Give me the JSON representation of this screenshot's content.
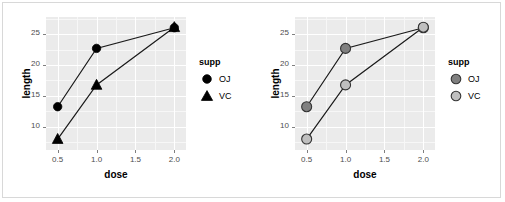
{
  "chart_data": [
    {
      "id": "left",
      "type": "line",
      "title": "",
      "xlabel": "dose",
      "ylabel": "length",
      "xlim": [
        0.35,
        2.15
      ],
      "ylim": [
        6.2,
        27.8
      ],
      "xticks": [
        "0.5",
        "1.0",
        "1.5",
        "2.0"
      ],
      "xtickvals": [
        0.5,
        1.0,
        1.5,
        2.0
      ],
      "yticks": [
        "10",
        "15",
        "20",
        "25"
      ],
      "ytickvals": [
        10,
        15,
        20,
        25
      ],
      "grid": true,
      "legend": {
        "title": "supp",
        "position": "right",
        "entries": [
          {
            "label": "OJ",
            "shape": "circle",
            "fill": "#000000",
            "stroke": "#000000"
          },
          {
            "label": "VC",
            "shape": "triangle",
            "fill": "#000000",
            "stroke": "#000000"
          }
        ]
      },
      "x": [
        0.5,
        1.0,
        2.0
      ],
      "series": [
        {
          "name": "OJ",
          "shape": "circle",
          "fill": "#000000",
          "stroke": "#000000",
          "line": "#1a1a1a",
          "values": [
            13.23,
            22.7,
            26.06
          ]
        },
        {
          "name": "VC",
          "shape": "triangle",
          "fill": "#000000",
          "stroke": "#000000",
          "line": "#1a1a1a",
          "values": [
            7.98,
            16.77,
            26.14
          ]
        }
      ]
    },
    {
      "id": "right",
      "type": "line",
      "title": "",
      "xlabel": "dose",
      "ylabel": "length",
      "xlim": [
        0.35,
        2.15
      ],
      "ylim": [
        6.2,
        27.8
      ],
      "xticks": [
        "0.5",
        "1.0",
        "1.5",
        "2.0"
      ],
      "xtickvals": [
        0.5,
        1.0,
        1.5,
        2.0
      ],
      "yticks": [
        "10",
        "15",
        "20",
        "25"
      ],
      "ytickvals": [
        10,
        15,
        20,
        25
      ],
      "grid": true,
      "legend": {
        "title": "supp",
        "position": "right",
        "entries": [
          {
            "label": "OJ",
            "shape": "circle",
            "fill": "#808080",
            "stroke": "#333333"
          },
          {
            "label": "VC",
            "shape": "circle",
            "fill": "#bfbfbf",
            "stroke": "#333333"
          }
        ]
      },
      "x": [
        0.5,
        1.0,
        2.0
      ],
      "series": [
        {
          "name": "OJ",
          "shape": "circle",
          "fill": "#808080",
          "stroke": "#333333",
          "line": "#1a1a1a",
          "values": [
            13.23,
            22.7,
            26.06
          ]
        },
        {
          "name": "VC",
          "shape": "circle",
          "fill": "#bfbfbf",
          "stroke": "#333333",
          "line": "#1a1a1a",
          "values": [
            7.98,
            16.77,
            26.14
          ]
        }
      ]
    }
  ],
  "panels": {
    "left": {
      "legend_title": "supp",
      "legend_oj": "OJ",
      "legend_vc": "VC",
      "xlabel": "dose",
      "ylabel": "length",
      "xt0": "0.5",
      "xt1": "1.0",
      "xt2": "1.5",
      "xt3": "2.0",
      "yt0": "10",
      "yt1": "15",
      "yt2": "20",
      "yt3": "25"
    },
    "right": {
      "legend_title": "supp",
      "legend_oj": "OJ",
      "legend_vc": "VC",
      "xlabel": "dose",
      "ylabel": "length",
      "xt0": "0.5",
      "xt1": "1.0",
      "xt2": "1.5",
      "xt3": "2.0",
      "yt0": "10",
      "yt1": "15",
      "yt2": "20",
      "yt3": "25"
    }
  },
  "colors": {
    "panel_background": "#ebebeb",
    "gridline_major": "#ffffff",
    "gridline_minor": "#f7f7f7",
    "axis_text": "#4d4d4d",
    "page_background": "#ffffff",
    "border": "#d8d8d8"
  }
}
